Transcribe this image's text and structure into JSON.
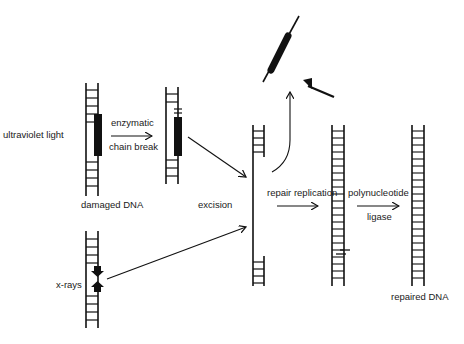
{
  "diagram": {
    "title": "DNA excision repair",
    "labels": {
      "ultraviolet_light": "ultraviolet light",
      "enzymatic": "enzymatic",
      "chain_break": "chain break",
      "damaged_dna": "damaged DNA",
      "excision": "excision",
      "repair_replication": "repair replication",
      "polynucleotide": "polynucleotide",
      "ligase": "ligase",
      "x_rays": "x-rays",
      "repaired_dna": "repaired DNA"
    },
    "colors": {
      "ink": "#111111",
      "background": "#ffffff"
    }
  }
}
